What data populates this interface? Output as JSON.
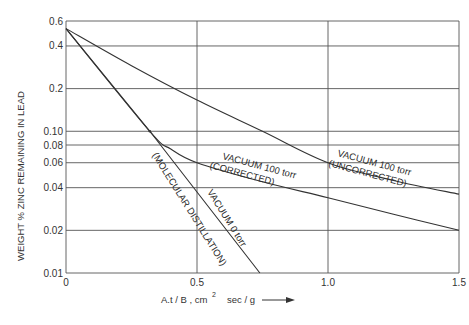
{
  "chart_data": {
    "type": "line",
    "title": "",
    "xlabel": "A.t / B , cm² sec / g",
    "ylabel": "WEIGHT % ZINC REMAINING IN LEAD",
    "xlim": [
      0,
      1.5
    ],
    "ylim": [
      0.01,
      0.6
    ],
    "yscale": "log",
    "grid": true,
    "x_ticks": [
      "0",
      "0.5",
      "1.0",
      "1.5"
    ],
    "x_tick_values": [
      0,
      0.5,
      1.0,
      1.5
    ],
    "y_ticks": [
      "0.6",
      "0.4",
      "0.2",
      "0.10",
      "0.08",
      "0.06",
      "0.04",
      "0.02",
      "0.01"
    ],
    "y_tick_values": [
      0.6,
      0.4,
      0.2,
      0.1,
      0.08,
      0.06,
      0.04,
      0.02,
      0.01
    ],
    "series": [
      {
        "name": "VACUUM 100 torr (UNCORRECTED)",
        "x": [
          0,
          0.25,
          0.5,
          0.75,
          1.0,
          1.25,
          1.5
        ],
        "values": [
          0.53,
          0.29,
          0.166,
          0.1,
          0.06,
          0.045,
          0.036
        ]
      },
      {
        "name": "VACUUM 100 torr (CORRECTED)",
        "x": [
          0,
          0.32,
          0.4,
          0.5,
          0.75,
          1.0,
          1.25,
          1.5
        ],
        "values": [
          0.53,
          0.1,
          0.075,
          0.06,
          0.044,
          0.034,
          0.026,
          0.02
        ]
      },
      {
        "name": "VACUUM 0 torr (MOLECULAR DISTILLATION)",
        "x": [
          0,
          0.32,
          0.74
        ],
        "values": [
          0.53,
          0.1,
          0.01
        ]
      }
    ],
    "annotations": [
      {
        "text_line1": "VACUUM 100 torr",
        "text_line2": "(UNCORRECTED)"
      },
      {
        "text_line1": "VACUUM 100 torr",
        "text_line2": "(CORRECTED)"
      },
      {
        "text_line1": "VACUUM 0 torr",
        "text_line2": "(MOLECULAR DISTILLATION)"
      }
    ],
    "x_arrow": true
  },
  "labels": {
    "ylabel": "WEIGHT % ZINC REMAINING IN LEAD",
    "xlabel_main": "A.t / B ,  cm",
    "xlabel_sup": "2",
    "xlabel_tail": "sec / g",
    "unc_1": "VACUUM  100 torr",
    "unc_2": "(UNCORRECTED)",
    "cor_1": "VACUUM  100 torr",
    "cor_2": "(CORRECTED)",
    "v0_1": "VACUUM  0  torr",
    "v0_2": "(MOLECULAR  DISTILLATION)"
  }
}
